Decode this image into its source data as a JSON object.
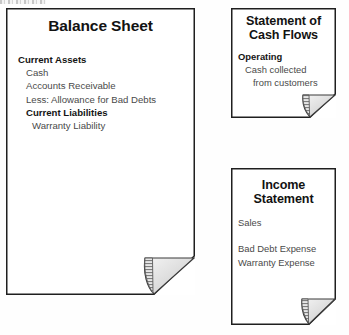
{
  "diagram": {
    "type": "document-flow",
    "background_color": "#fefefe",
    "border_color": "#1f1f1f",
    "fold_fill_color": "#d9d9d9",
    "text_color": "#4a4a4a",
    "heading_color": "#121212"
  },
  "documents": [
    {
      "id": "balance-sheet",
      "title": "Balance Sheet",
      "title_lines": [
        "Balance Sheet"
      ],
      "lines": [
        {
          "text": "Current Assets",
          "bold": true,
          "indent": 0
        },
        {
          "text": "Cash",
          "bold": false,
          "indent": 1
        },
        {
          "text": "Accounts Receivable",
          "bold": false,
          "indent": 1
        },
        {
          "text": "Less: Allowance for Bad Debts",
          "bold": false,
          "indent": 1
        },
        {
          "text": "Current Liabilities",
          "bold": true,
          "indent": 1
        },
        {
          "text": "Warranty Liability",
          "bold": false,
          "indent": 1
        }
      ]
    },
    {
      "id": "cash-flows",
      "title": "Statement of Cash Flows",
      "title_lines": [
        "Statement of",
        "Cash Flows"
      ],
      "lines": [
        {
          "text": "Operating",
          "bold": true,
          "indent": 0
        },
        {
          "text": "Cash collected",
          "bold": false,
          "indent": 1
        },
        {
          "text": "from customers",
          "bold": false,
          "indent": 2
        }
      ]
    },
    {
      "id": "income-statement",
      "title": "Income Statement",
      "title_lines": [
        "Income",
        "Statement"
      ],
      "lines": [
        {
          "text": "Sales",
          "bold": false,
          "indent": 0
        },
        {
          "text": "",
          "bold": false,
          "indent": 0,
          "spacer": true
        },
        {
          "text": "Bad Debt Expense",
          "bold": false,
          "indent": 0
        },
        {
          "text": "Warranty Expense",
          "bold": false,
          "indent": 0
        }
      ]
    }
  ]
}
